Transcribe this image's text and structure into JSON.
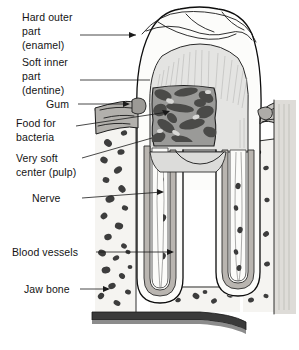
{
  "figure": {
    "width": 299,
    "height": 350,
    "background_color": "#ffffff"
  },
  "labels": [
    {
      "id": "enamel",
      "name": "hard-outer-part-enamel",
      "lines": [
        "Hard outer",
        "part",
        "(enamel)"
      ],
      "line1": "Hard outer",
      "line2": "part",
      "line3": "(enamel)",
      "leader": "arrow",
      "target": "crown enamel outer wall"
    },
    {
      "id": "dentine",
      "name": "soft-inner-part-dentine",
      "lines": [
        "Soft inner",
        "part",
        "(dentine)"
      ],
      "line1": "Soft inner",
      "line2": "part",
      "line3": "(dentine)",
      "leader": "line",
      "target": "dentine layer under enamel"
    },
    {
      "id": "gum",
      "name": "gum",
      "lines": [
        "Gum"
      ],
      "line1": "Gum",
      "leader": "arrow",
      "target": "gingival tissue at tooth neck"
    },
    {
      "id": "food-bacteria",
      "name": "food-for-bacteria",
      "lines": [
        "Food for",
        "bacteria"
      ],
      "line1": "Food for",
      "line2": "bacteria",
      "leader": "arrow",
      "target": "dark decay cavity in crown"
    },
    {
      "id": "pulp",
      "name": "very-soft-center-pulp",
      "lines": [
        "Very soft",
        "center (pulp)"
      ],
      "line1": "Very soft",
      "line2": "center (pulp)",
      "leader": "line",
      "target": "pulp chamber"
    },
    {
      "id": "nerve",
      "name": "nerve",
      "lines": [
        "Nerve"
      ],
      "line1": "Nerve",
      "leader": "line",
      "target": "nerve canal in root"
    },
    {
      "id": "blood-vessels",
      "name": "blood-vessels",
      "lines": [
        "Blood vessels"
      ],
      "line1": "Blood vessels",
      "leader": "line",
      "target": "vessels entering root apex"
    },
    {
      "id": "jaw-bone",
      "name": "jaw-bone",
      "lines": [
        "Jaw bone"
      ],
      "line1": "Jaw bone",
      "leader": "arrow",
      "target": "trabecular bone surrounding roots"
    }
  ],
  "structures": {
    "enamel_fill": "#fdfdfd",
    "dentine_fill": "#e3e3e3",
    "pulp_fill": "#fbfbfb",
    "decay_fill": "#8e8e8e",
    "gum_fill": "#b0b0b0",
    "bone_fill": "#f4f4f2",
    "canal_fill": "#a8a8a8",
    "outline_color": "#0d0d0d",
    "speckle_color": "#3a3a3a"
  }
}
